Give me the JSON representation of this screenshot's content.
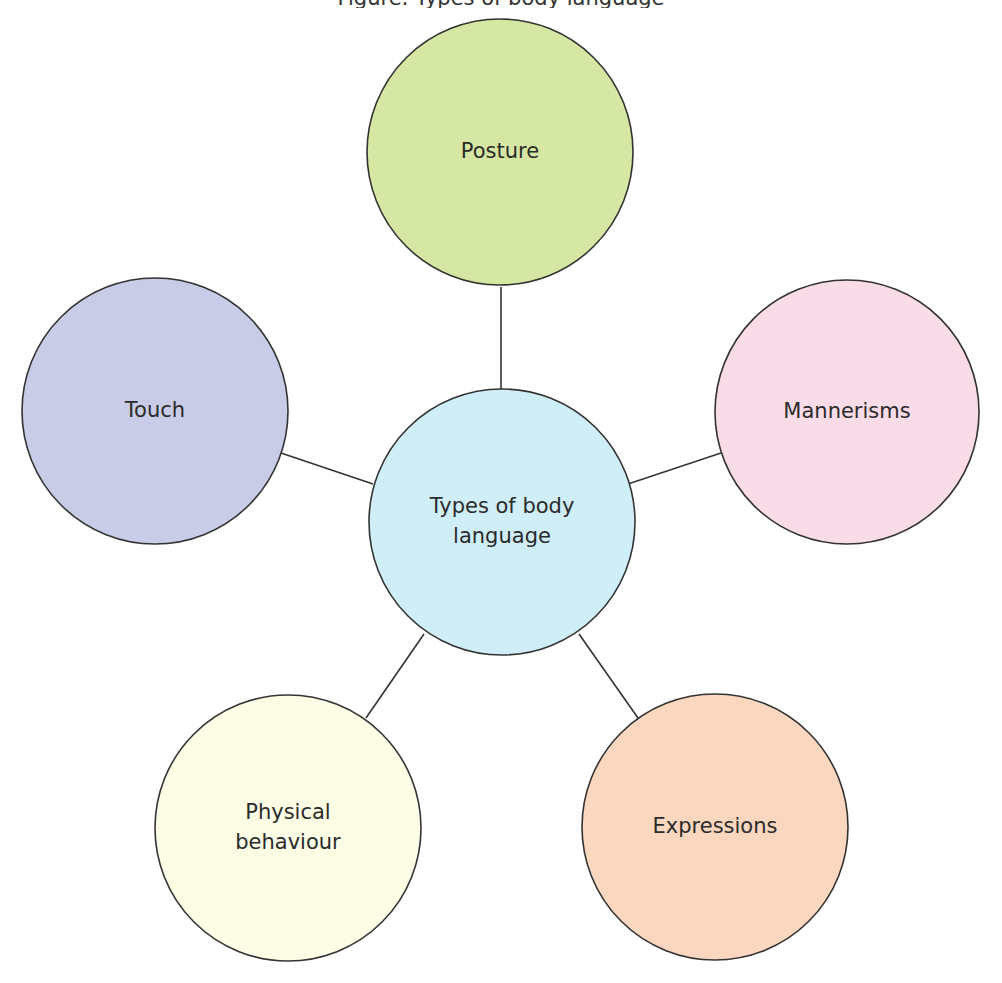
{
  "caption": {
    "text": "Figure: Types of body language"
  },
  "colors": {
    "stroke": "#333333",
    "text": "#2b2b2b",
    "center": "#cfeef8",
    "posture": "#d5e7a2",
    "touch": "#c9cce6",
    "mannerisms": "#fadbe8",
    "physical": "#fdfde6",
    "expressions": "#fbd7bf"
  },
  "diagram": {
    "center": {
      "label_lines": [
        "Types of body",
        "language"
      ],
      "cx": 502,
      "cy": 522,
      "r": 133
    },
    "nodes": [
      {
        "id": "posture",
        "label_lines": [
          "Posture"
        ],
        "cx": 500,
        "cy": 152,
        "r": 133,
        "connector": {
          "x1": 501,
          "y1": 287,
          "x2": 501,
          "y2": 389
        }
      },
      {
        "id": "touch",
        "label_lines": [
          "Touch"
        ],
        "cx": 155,
        "cy": 411,
        "r": 133,
        "connector": {
          "x1": 281,
          "y1": 453,
          "x2": 373,
          "y2": 484
        }
      },
      {
        "id": "mannerisms",
        "label_lines": [
          "Mannerisms"
        ],
        "cx": 847,
        "cy": 412,
        "r": 132,
        "connector": {
          "x1": 628,
          "y1": 484,
          "x2": 721,
          "y2": 453
        }
      },
      {
        "id": "physical",
        "label_lines": [
          "Physical",
          "behaviour"
        ],
        "cx": 288,
        "cy": 828,
        "r": 133,
        "connector": {
          "x1": 424,
          "y1": 634,
          "x2": 366,
          "y2": 718
        }
      },
      {
        "id": "expressions",
        "label_lines": [
          "Expressions"
        ],
        "cx": 715,
        "cy": 827,
        "r": 133,
        "connector": {
          "x1": 579,
          "y1": 634,
          "x2": 638,
          "y2": 718
        }
      }
    ]
  }
}
